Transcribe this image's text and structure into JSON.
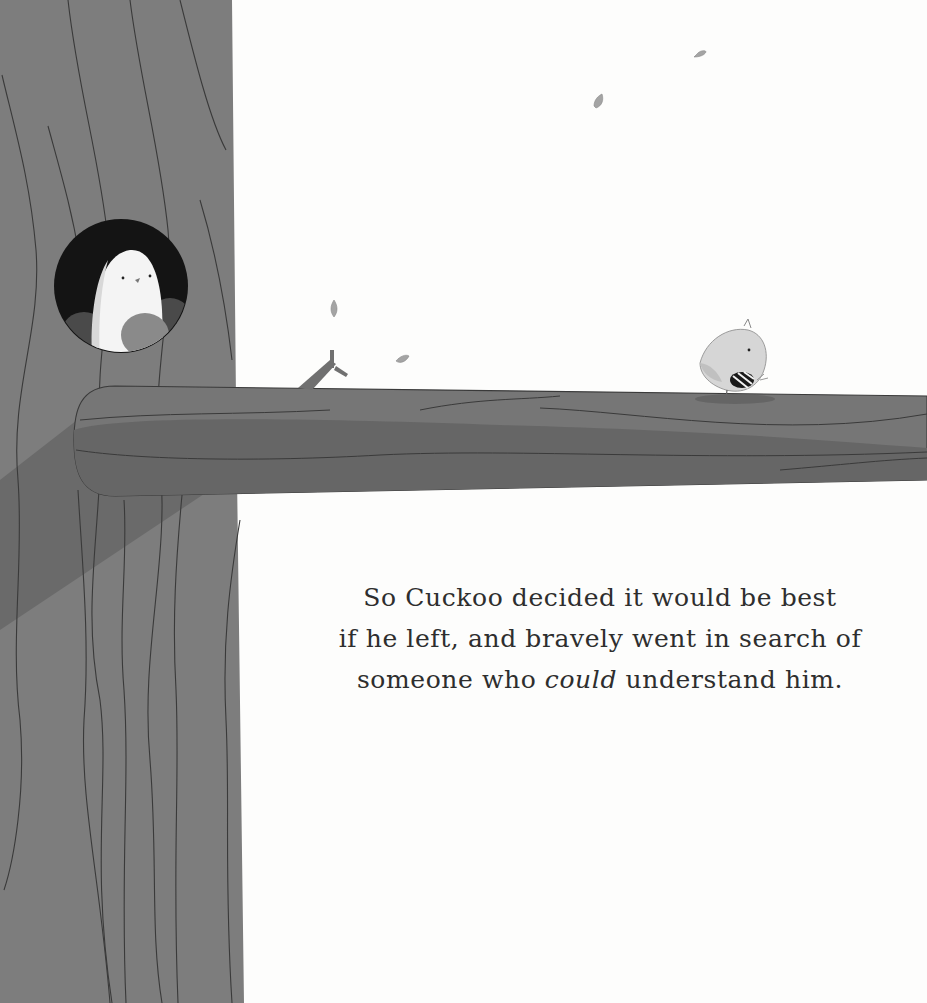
{
  "page": {
    "type": "picture-book-page",
    "colors": {
      "background": "#fdfdfc",
      "trunk": "#7d7d7d",
      "trunk_shadow": "#6a6a6a",
      "branch": "#767676",
      "branch_shadow": "#666666",
      "outline": "#3a3a3a",
      "hole": "#141414",
      "text": "#2e2e2e"
    }
  },
  "story": {
    "line1": "So Cuckoo decided it would be best",
    "line2": "if he left, and bravely went in search of",
    "line3_before": "someone who ",
    "line3_emphasis": "could",
    "line3_after": " understand him."
  },
  "illustration": {
    "characters": [
      {
        "name": "white-bird-in-hole",
        "description": "White bird peeking out of a round tree hollow with two dark chicks"
      },
      {
        "name": "cuckoo",
        "description": "Small round bird with striped belly walking along branch"
      }
    ],
    "falling_leaves": 5
  }
}
